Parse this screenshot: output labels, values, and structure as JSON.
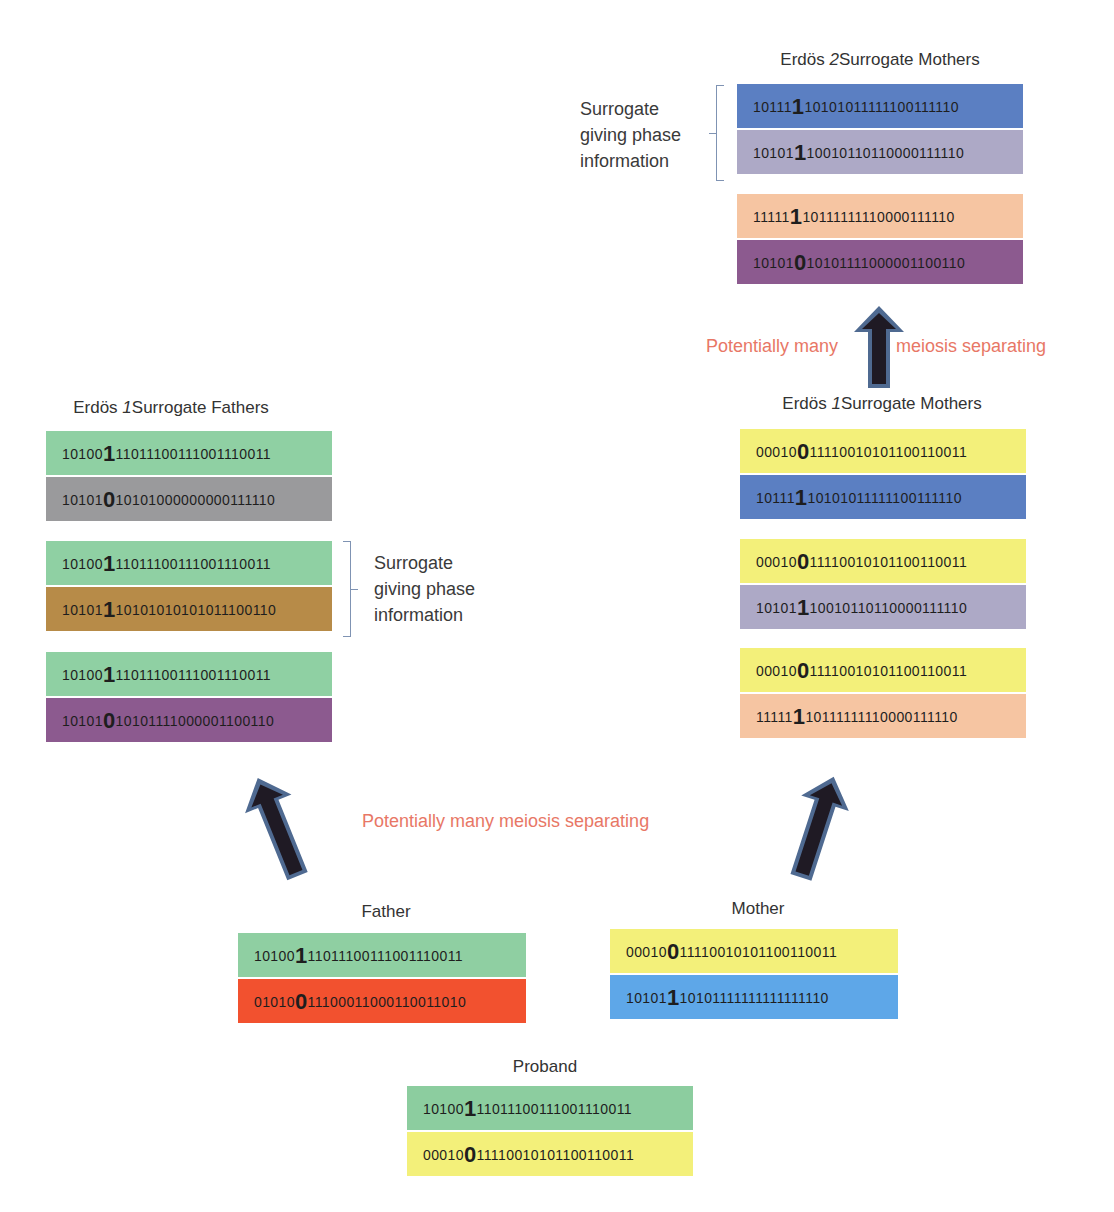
{
  "erdos2_mothers": {
    "title_prefix": "Erdös",
    "title_num": "2",
    "title_suffix": "Surrogate Mothers",
    "bracket_note": "Surrogate giving phase information",
    "pairs": [
      {
        "rows": [
          {
            "pre": "10111",
            "mid": "1",
            "post": "10101011111100111110",
            "color": "#5b7fc2"
          },
          {
            "pre": "10101",
            "mid": "1",
            "post": "10010110110000111110",
            "color": "#ada9c6"
          }
        ]
      },
      {
        "rows": [
          {
            "pre": "11111",
            "mid": "1",
            "post": "10111111110000111110",
            "color": "#f6c5a2"
          },
          {
            "pre": "10101",
            "mid": "0",
            "post": "10101111000001100110",
            "color": "#8c5a8f"
          }
        ]
      }
    ]
  },
  "meiosis_upper": {
    "left": "Potentially many",
    "right": "meiosis separating"
  },
  "erdos1_mothers": {
    "title_prefix": "Erdös",
    "title_num": "1",
    "title_suffix": "Surrogate Mothers",
    "pairs": [
      {
        "rows": [
          {
            "pre": "00010",
            "mid": "0",
            "post": "11110010101100110011",
            "color": "#f3f07a"
          },
          {
            "pre": "10111",
            "mid": "1",
            "post": "10101011111100111110",
            "color": "#5b7fc2"
          }
        ]
      },
      {
        "rows": [
          {
            "pre": "00010",
            "mid": "0",
            "post": "11110010101100110011",
            "color": "#f3f07a"
          },
          {
            "pre": "10101",
            "mid": "1",
            "post": "10010110110000111110",
            "color": "#ada9c6"
          }
        ]
      },
      {
        "rows": [
          {
            "pre": "00010",
            "mid": "0",
            "post": "11110010101100110011",
            "color": "#f3f07a"
          },
          {
            "pre": "11111",
            "mid": "1",
            "post": "10111111110000111110",
            "color": "#f6c5a2"
          }
        ]
      }
    ]
  },
  "erdos1_fathers": {
    "title_prefix": "Erdös",
    "title_num": "1",
    "title_suffix": "Surrogate Fathers",
    "bracket_note": "Surrogate giving phase information",
    "pairs": [
      {
        "rows": [
          {
            "pre": "10100",
            "mid": "1",
            "post": "11011100111001110011",
            "color": "#8fd0a3"
          },
          {
            "pre": "10101",
            "mid": "0",
            "post": "10101000000000111110",
            "color": "#9a9a9c"
          }
        ]
      },
      {
        "rows": [
          {
            "pre": "10100",
            "mid": "1",
            "post": "11011100111001110011",
            "color": "#8fd0a3"
          },
          {
            "pre": "10101",
            "mid": "1",
            "post": "10101010101011100110",
            "color": "#b78b48"
          }
        ]
      },
      {
        "rows": [
          {
            "pre": "10100",
            "mid": "1",
            "post": "11011100111001110011",
            "color": "#8fd0a3"
          },
          {
            "pre": "10101",
            "mid": "0",
            "post": "10101111000001100110",
            "color": "#8c5a8f"
          }
        ]
      }
    ]
  },
  "meiosis_lower": {
    "text": "Potentially many meiosis separating"
  },
  "father": {
    "title": "Father",
    "rows": [
      {
        "pre": "10100",
        "mid": "1",
        "post": "11011100111001110011",
        "color": "#8fcfa2"
      },
      {
        "pre": "01010",
        "mid": "0",
        "post": "11100011000110011010",
        "color": "#f2512f"
      }
    ]
  },
  "mother": {
    "title": "Mother",
    "rows": [
      {
        "pre": "00010",
        "mid": "0",
        "post": "11110010101100110011",
        "color": "#f3f07a"
      },
      {
        "pre": "10101",
        "mid": "1",
        "post": "10101111111111111110",
        "color": "#5ea7e8"
      }
    ]
  },
  "proband": {
    "title": "Proband",
    "rows": [
      {
        "pre": "10100",
        "mid": "1",
        "post": "11011100111001110011",
        "color": "#8ccd9f"
      },
      {
        "pre": "00010",
        "mid": "0",
        "post": "11110010101100110011",
        "color": "#f3f07a"
      }
    ]
  },
  "colors": {
    "arrow_fill": "#1f1a24",
    "arrow_outline": "#4f6a91",
    "meiosis_text": "#e87766",
    "bracket": "#7f93b3"
  }
}
